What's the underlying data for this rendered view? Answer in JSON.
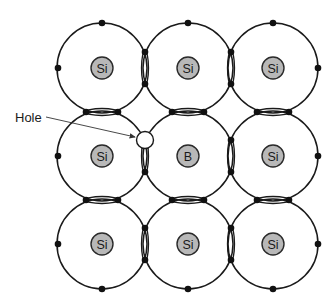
{
  "diagram": {
    "hole_label": "Hole",
    "atoms": [
      {
        "row": 0,
        "col": 0,
        "symbol": "Si"
      },
      {
        "row": 0,
        "col": 1,
        "symbol": "Si"
      },
      {
        "row": 0,
        "col": 2,
        "symbol": "Si"
      },
      {
        "row": 1,
        "col": 0,
        "symbol": "Si"
      },
      {
        "row": 1,
        "col": 1,
        "symbol": "B"
      },
      {
        "row": 1,
        "col": 2,
        "symbol": "Si"
      },
      {
        "row": 2,
        "col": 0,
        "symbol": "Si"
      },
      {
        "row": 2,
        "col": 1,
        "symbol": "Si"
      },
      {
        "row": 2,
        "col": 2,
        "symbol": "Si"
      }
    ],
    "colors": {
      "nucleus_fill": "#b8b8b8",
      "line": "#1a1a1a",
      "electron": "#111111",
      "hole_fill": "#ffffff"
    }
  }
}
